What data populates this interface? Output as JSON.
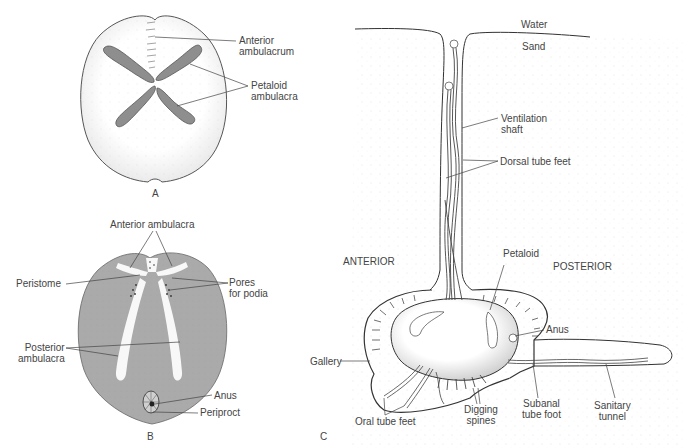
{
  "figure": {
    "panels": [
      {
        "id": "A",
        "label": "A",
        "view": "aboral (dorsal) surface of heart urchin test"
      },
      {
        "id": "B",
        "label": "B",
        "view": "oral (ventral) surface of heart urchin test"
      },
      {
        "id": "C",
        "label": "C",
        "view": "heart urchin burrowed in sand, lateral section"
      }
    ]
  },
  "panel_a": {
    "labels": {
      "anterior_ambulacrum": [
        "Anterior",
        "ambulacrum"
      ],
      "petaloid_ambulacra": [
        "Petaloid",
        "ambulacra"
      ]
    }
  },
  "panel_b": {
    "labels": {
      "anterior_ambulacra": "Anterior ambulacra",
      "peristome": "Peristome",
      "pores_for_podia": [
        "Pores",
        "for podia"
      ],
      "posterior_ambulacra": [
        "Posterior",
        "ambulacra"
      ],
      "anus": "Anus",
      "periproct": "Periproct"
    }
  },
  "panel_c": {
    "labels": {
      "water": "Water",
      "sand": "Sand",
      "ventilation_shaft": [
        "Ventilation",
        "shaft"
      ],
      "dorsal_tube_feet": "Dorsal tube feet",
      "anterior": "ANTERIOR",
      "posterior": "POSTERIOR",
      "petaloid": "Petaloid",
      "anus": "Anus",
      "gallery": "Gallery",
      "oral_tube_feet": "Oral tube feet",
      "digging_spines": [
        "Digging",
        "spines"
      ],
      "subanal_tube_foot": [
        "Subanal",
        "tube foot"
      ],
      "sanitary_tunnel": [
        "Sanitary",
        "tunnel"
      ]
    }
  },
  "colors": {
    "ink": "#3a3a3a",
    "oral_surface": "#a9a9a9",
    "petal": "#8e8e8e",
    "stipple": "#b8b8b8"
  }
}
